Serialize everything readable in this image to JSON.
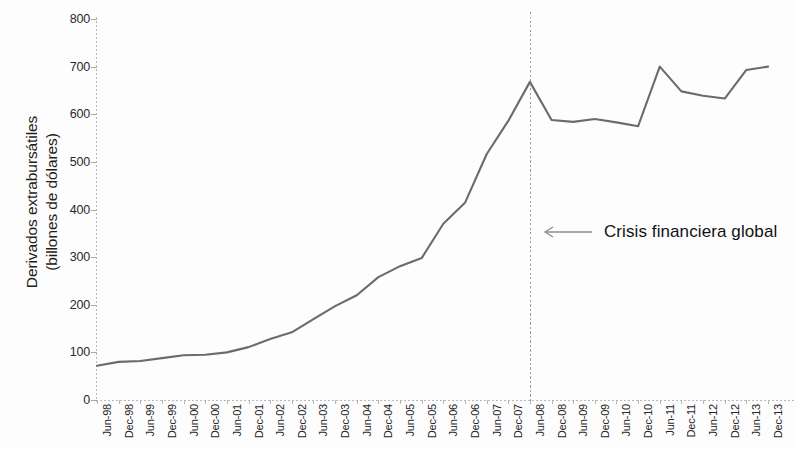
{
  "chart_data": {
    "type": "line",
    "title": "",
    "xlabel": "",
    "ylabel": "Derivados extrabursátiles (billones de dólares)",
    "ylabel_line1": "Derivados extrabursátiles",
    "ylabel_line2": "(billones de dólares)",
    "ylim": [
      0,
      800
    ],
    "ytick_values": [
      0,
      100,
      200,
      300,
      400,
      500,
      600,
      700,
      800
    ],
    "ytick_labels": [
      "0",
      "100",
      "200",
      "300",
      "400",
      "500",
      "600",
      "700",
      "800"
    ],
    "grid": false,
    "legend": "none",
    "line_color": "#6b6b6b",
    "categories": [
      "Jun-98",
      "Dec-98",
      "Jun-99",
      "Dec-99",
      "Jun-00",
      "Dec-00",
      "Jun-01",
      "Dec-01",
      "Jun-02",
      "Dec-02",
      "Jun-03",
      "Dec-03",
      "Jun-04",
      "Dec-04",
      "Jun-05",
      "Dec-05",
      "Jun-06",
      "Dec-06",
      "Jun-07",
      "Dec-07",
      "Jun-08",
      "Dec-08",
      "Jun-09",
      "Dec-09",
      "Jun-10",
      "Dec-10",
      "Jun-11",
      "Dec-11",
      "Jun-12",
      "Dec-12",
      "Jun-13",
      "Dec-13"
    ],
    "values": [
      72,
      80,
      82,
      88,
      94,
      95,
      100,
      111,
      128,
      142,
      170,
      197,
      220,
      258,
      281,
      298,
      370,
      414,
      516,
      586,
      668,
      588,
      584,
      590,
      583,
      575,
      700,
      648,
      639,
      633,
      693,
      700
    ],
    "annotations": [
      {
        "text": "Crisis financiera global",
        "arrow": "left-arrow",
        "at_category": "Jun-08"
      }
    ]
  }
}
